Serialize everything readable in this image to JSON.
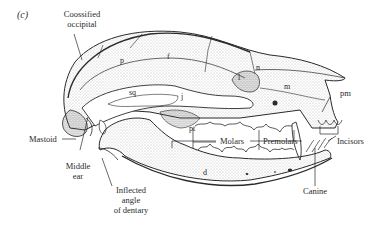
{
  "figure": {
    "panel_label": "(c)",
    "colors": {
      "ink": "#2a2a2a",
      "stipple": "#6a6a6a",
      "background": "#ffffff"
    }
  },
  "labels": {
    "coossified_occipital": [
      "Coossified",
      "occipital"
    ],
    "parietal": "p",
    "frontal": "f",
    "nasal": "n",
    "lacrimal": "l",
    "maxilla": "m",
    "premaxilla": "pm",
    "squamosal": "sq",
    "jugal": "j",
    "pterygoid": "pt",
    "dentary": "d",
    "mastoid": "Mastoid",
    "middle_ear": [
      "Middle",
      "ear"
    ],
    "inflected_angle": [
      "Inflected",
      "angle",
      "of dentary"
    ],
    "molars": "Molars",
    "premolars": "Premolars",
    "incisors": "Incisors",
    "canine": "Canine"
  }
}
